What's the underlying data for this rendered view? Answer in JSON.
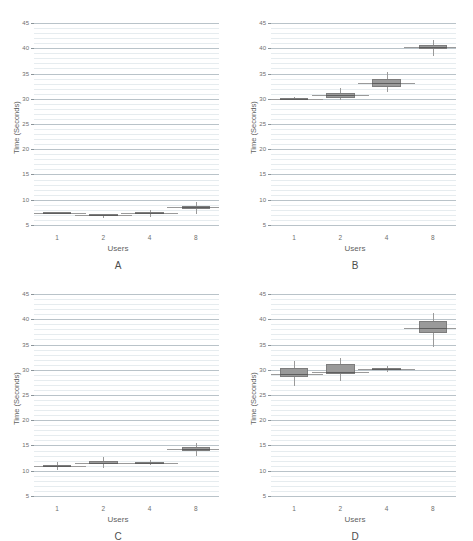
{
  "figure": {
    "background": "#ffffff",
    "box_fill": "#9a9a9a",
    "box_edge": "#7d7d7d",
    "grid_color": "#b9c3c9"
  },
  "chart_data": [
    {
      "type": "box",
      "panel": "A",
      "title": "",
      "xlabel": "Users",
      "ylabel": "Time (Seconds)",
      "categories": [
        "1",
        "2",
        "4",
        "8"
      ],
      "yticks": [
        5,
        10,
        15,
        20,
        25,
        30,
        35,
        40,
        45
      ],
      "ylim": [
        4,
        46
      ],
      "grid": true,
      "legend": "none",
      "boxes": [
        {
          "category": "1",
          "whisker_low": 7.3,
          "q1": 7.3,
          "median": 7.4,
          "q3": 7.5,
          "whisker_high": 7.6
        },
        {
          "category": "2",
          "whisker_low": 6.3,
          "q1": 6.7,
          "median": 6.9,
          "q3": 7.0,
          "whisker_high": 7.2
        },
        {
          "category": "4",
          "whisker_low": 6.6,
          "q1": 7.1,
          "median": 7.3,
          "q3": 7.5,
          "whisker_high": 8.0
        },
        {
          "category": "8",
          "whisker_low": 7.2,
          "q1": 8.2,
          "median": 8.5,
          "q3": 8.8,
          "whisker_high": 9.6
        }
      ]
    },
    {
      "type": "box",
      "panel": "B",
      "title": "",
      "xlabel": "Users",
      "ylabel": "Time (Seconds)",
      "categories": [
        "1",
        "2",
        "4",
        "8"
      ],
      "yticks": [
        5,
        10,
        15,
        20,
        25,
        30,
        35,
        40,
        45
      ],
      "ylim": [
        4,
        46
      ],
      "grid": true,
      "legend": "none",
      "boxes": [
        {
          "category": "1",
          "whisker_low": 29.8,
          "q1": 29.9,
          "median": 30.0,
          "q3": 30.1,
          "whisker_high": 30.4
        },
        {
          "category": "2",
          "whisker_low": 29.8,
          "q1": 30.2,
          "median": 30.7,
          "q3": 31.1,
          "whisker_high": 32.2
        },
        {
          "category": "4",
          "whisker_low": 31.3,
          "q1": 32.4,
          "median": 33.1,
          "q3": 34.0,
          "whisker_high": 35.3
        },
        {
          "category": "8",
          "whisker_low": 38.4,
          "q1": 39.8,
          "median": 40.2,
          "q3": 40.6,
          "whisker_high": 41.6
        }
      ]
    },
    {
      "type": "box",
      "panel": "C",
      "title": "",
      "xlabel": "Users",
      "ylabel": "Time (Seconds)",
      "categories": [
        "1",
        "2",
        "4",
        "8"
      ],
      "yticks": [
        5,
        10,
        15,
        20,
        25,
        30,
        35,
        40,
        45
      ],
      "ylim": [
        4,
        46
      ],
      "grid": true,
      "legend": "none",
      "boxes": [
        {
          "category": "1",
          "whisker_low": 10.2,
          "q1": 10.7,
          "median": 10.9,
          "q3": 11.1,
          "whisker_high": 11.8
        },
        {
          "category": "2",
          "whisker_low": 10.6,
          "q1": 11.4,
          "median": 11.6,
          "q3": 11.9,
          "whisker_high": 12.7
        },
        {
          "category": "4",
          "whisker_low": 11.2,
          "q1": 11.4,
          "median": 11.5,
          "q3": 11.6,
          "whisker_high": 12.1
        },
        {
          "category": "8",
          "whisker_low": 13.0,
          "q1": 14.0,
          "median": 14.3,
          "q3": 14.6,
          "whisker_high": 15.5
        }
      ]
    },
    {
      "type": "box",
      "panel": "D",
      "title": "",
      "xlabel": "Users",
      "ylabel": "Time (Seconds)",
      "categories": [
        "1",
        "2",
        "4",
        "8"
      ],
      "yticks": [
        5,
        10,
        15,
        20,
        25,
        30,
        35,
        40,
        45
      ],
      "ylim": [
        4,
        46
      ],
      "grid": true,
      "legend": "none",
      "boxes": [
        {
          "category": "1",
          "whisker_low": 26.7,
          "q1": 28.6,
          "median": 29.1,
          "q3": 30.4,
          "whisker_high": 31.7
        },
        {
          "category": "2",
          "whisker_low": 27.8,
          "q1": 29.1,
          "median": 29.6,
          "q3": 31.2,
          "whisker_high": 32.3
        },
        {
          "category": "4",
          "whisker_low": 29.6,
          "q1": 30.0,
          "median": 30.1,
          "q3": 30.3,
          "whisker_high": 30.7
        },
        {
          "category": "8",
          "whisker_low": 34.5,
          "q1": 37.3,
          "median": 38.3,
          "q3": 39.7,
          "whisker_high": 41.2
        }
      ]
    }
  ]
}
